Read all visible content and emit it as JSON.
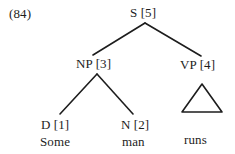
{
  "figure": {
    "example_number": "(84)",
    "type": "syntax-tree",
    "ink_color": "#1d1d1d",
    "background_color": "#ffffff"
  },
  "tree": {
    "nodes": {
      "s": {
        "label": "S [5]",
        "category": "S",
        "index": "[5]"
      },
      "np": {
        "label": "NP [3]",
        "category": "NP",
        "index": "[3]"
      },
      "vp": {
        "label": "VP [4]",
        "category": "VP",
        "index": "[4]"
      },
      "d": {
        "label": "D [1]",
        "category": "D",
        "index": "[1]"
      },
      "n": {
        "label": "N [2]",
        "category": "N",
        "index": "[2]"
      }
    },
    "terminals": {
      "some": "Some",
      "man": "man",
      "runs": "runs"
    },
    "triangle_under": "VP [4]"
  }
}
